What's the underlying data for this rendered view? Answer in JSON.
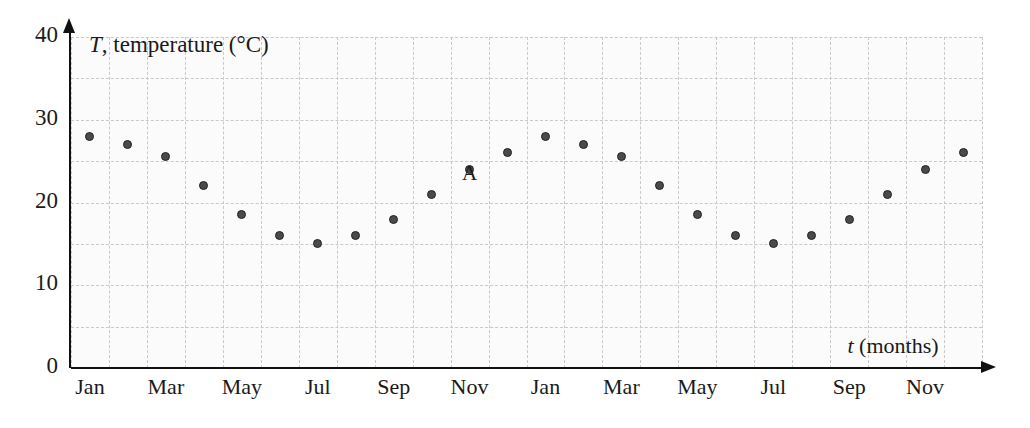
{
  "chart_data": {
    "type": "scatter",
    "title": "",
    "xlabel": "t (months)",
    "ylabel": "T, temperature (°C)",
    "ylim": [
      0,
      40
    ],
    "yticks": [
      0,
      10,
      20,
      30,
      40
    ],
    "ytick_labels": [
      "0",
      "10",
      "20",
      "30",
      "40"
    ],
    "y_gridline_step": 5,
    "grid": true,
    "legend": null,
    "x_axis_kind": "months",
    "x_count": 24,
    "xtick_labels": [
      "Jan",
      "Mar",
      "May",
      "Jul",
      "Sep",
      "Nov",
      "Jan",
      "Mar",
      "May",
      "Jul",
      "Sep",
      "Nov"
    ],
    "xtick_months": [
      1,
      3,
      5,
      7,
      9,
      11,
      13,
      15,
      17,
      19,
      21,
      23
    ],
    "categories": [
      "Jan",
      "Feb",
      "Mar",
      "Apr",
      "May",
      "Jun",
      "Jul",
      "Aug",
      "Sep",
      "Oct",
      "Nov",
      "Dec",
      "Jan",
      "Feb",
      "Mar",
      "Apr",
      "May",
      "Jun",
      "Jul",
      "Aug",
      "Sep",
      "Oct",
      "Nov",
      "Dec"
    ],
    "values": [
      28,
      27,
      25.5,
      22,
      18.5,
      16,
      15,
      16,
      18,
      21,
      24,
      26,
      28,
      27,
      25.5,
      22,
      18.5,
      16,
      15,
      16,
      18,
      21,
      24,
      26
    ],
    "annotations": [
      {
        "label": "A",
        "month_index": 10,
        "category": "Oct",
        "value": 21
      }
    ],
    "point_color": "#4a4a4a",
    "grid_color": "#c9c9c9",
    "axis_color": "#111111",
    "background": "#fbfbfb"
  },
  "axis_titles": {
    "y_symbol": "T",
    "y_rest": ", temperature (°C)",
    "x_symbol": "t",
    "x_rest": " (months)"
  }
}
